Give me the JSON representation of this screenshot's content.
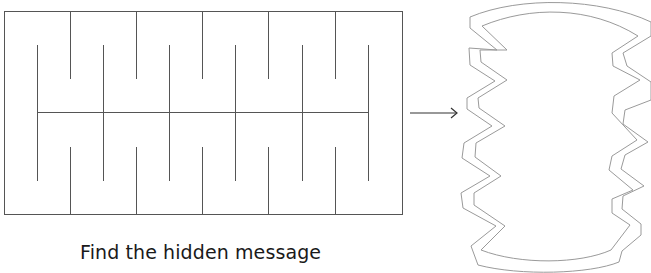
{
  "caption": "Find the hidden message",
  "colors": {
    "line": "#555555",
    "outline": "#9a9a9a",
    "text": "#1a1a1a",
    "background": "#ffffff"
  },
  "maze": {
    "frame": {
      "x": 4,
      "y": 11,
      "width": 398,
      "height": 203
    },
    "middle_line": {
      "x1": 37,
      "x2": 368,
      "y": 112
    },
    "top_strips_x": [
      70,
      136,
      202,
      268,
      335
    ],
    "upper_mid_strips_x": [
      37,
      103,
      169,
      235,
      302,
      368
    ],
    "lower_mid_strips_x": [
      37,
      103,
      169,
      235,
      302,
      368
    ],
    "bottom_strips_x": [
      70,
      136,
      202,
      268,
      335
    ]
  },
  "arrow": {
    "x1": 410,
    "x2": 458,
    "y": 113,
    "icon": "right-arrow"
  },
  "result_shape": {
    "description": "closed ring with zigzag sides (folded strip)"
  }
}
